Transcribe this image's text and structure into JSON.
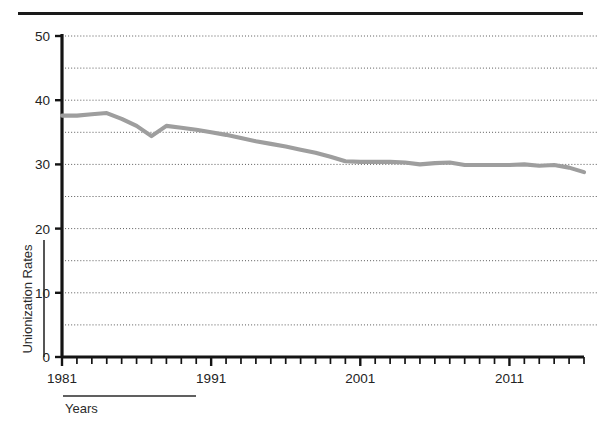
{
  "figure": {
    "top_rule": true,
    "axis_label_x": "Years",
    "axis_label_y": "Unionization Rates"
  },
  "chart_data": {
    "type": "line",
    "title": "",
    "subtitle": "",
    "xlabel": "Years",
    "ylabel": "Unionization Rates",
    "xlim": [
      1981,
      2016
    ],
    "ylim": [
      0,
      50
    ],
    "grid": true,
    "grid_axis": "y",
    "grid_style": "dotted",
    "legend": false,
    "legend_position": "none",
    "y_ticks_labeled": [
      0,
      10,
      20,
      30,
      40,
      50
    ],
    "y_ticks_gridlines": [
      5,
      10,
      15,
      20,
      25,
      30,
      35,
      40,
      45,
      50
    ],
    "x_ticks_labeled": [
      1981,
      1991,
      2001,
      2011
    ],
    "x_tick_interval": 1,
    "line_color": "#9e9e9e",
    "series": [
      {
        "name": "Unionization Rate",
        "x": [
          1981,
          1982,
          1983,
          1984,
          1985,
          1986,
          1987,
          1988,
          1989,
          1990,
          1991,
          1992,
          1993,
          1994,
          1995,
          1996,
          1997,
          1998,
          1999,
          2000,
          2001,
          2002,
          2003,
          2004,
          2005,
          2006,
          2007,
          2008,
          2009,
          2010,
          2011,
          2012,
          2013,
          2014,
          2015,
          2016
        ],
        "values": [
          37.6,
          37.6,
          37.8,
          38.0,
          37.1,
          36.0,
          34.4,
          36.0,
          35.7,
          35.4,
          35.0,
          34.6,
          34.1,
          33.6,
          33.2,
          32.8,
          32.3,
          31.8,
          31.2,
          30.5,
          30.4,
          30.4,
          30.4,
          30.3,
          30.0,
          30.2,
          30.3,
          29.9,
          29.9,
          29.9,
          29.9,
          30.0,
          29.8,
          29.9,
          29.5,
          28.8
        ]
      }
    ]
  },
  "axis_tick_labels": {
    "y": [
      "50",
      "40",
      "30",
      "20",
      "10",
      "0"
    ],
    "x": [
      "1981",
      "1991",
      "2001",
      "2011"
    ]
  }
}
